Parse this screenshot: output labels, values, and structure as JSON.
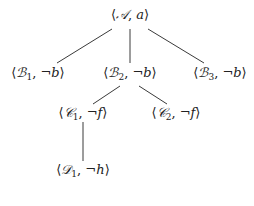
{
  "diagram": {
    "type": "tree",
    "edge_color": "#3a3a3a",
    "text_color": "#222222",
    "nodes": [
      {
        "id": "A",
        "open": "⟨",
        "set": "𝒜",
        "sub": "",
        "sep": ", ",
        "literal": "a",
        "close": "⟩",
        "x": 130,
        "y": 15
      },
      {
        "id": "B1",
        "open": "⟨",
        "set": "ℬ",
        "sub": "1",
        "sep": ", ",
        "literal": "¬b",
        "close": "⟩",
        "x": 38,
        "y": 72
      },
      {
        "id": "B2",
        "open": "⟨",
        "set": "ℬ",
        "sub": "2",
        "sep": ", ",
        "literal": "¬b",
        "close": "⟩",
        "x": 130,
        "y": 72
      },
      {
        "id": "B3",
        "open": "⟨",
        "set": "ℬ",
        "sub": "3",
        "sep": ", ",
        "literal": "¬b",
        "close": "⟩",
        "x": 220,
        "y": 72
      },
      {
        "id": "C1",
        "open": "⟨",
        "set": "𝒞",
        "sub": "1",
        "sep": ", ",
        "literal": "¬f",
        "close": "⟩",
        "x": 83,
        "y": 113
      },
      {
        "id": "C2",
        "open": "⟨",
        "set": "𝒞",
        "sub": "2",
        "sep": ", ",
        "literal": "¬f",
        "close": "⟩",
        "x": 176,
        "y": 113
      },
      {
        "id": "D1",
        "open": "⟨",
        "set": "𝒟",
        "sub": "1",
        "sep": ", ",
        "literal": "¬h",
        "close": "⟩",
        "x": 83,
        "y": 170
      }
    ],
    "edges": [
      {
        "from": "A",
        "to": "B1",
        "x1": 112,
        "y1": 29,
        "x2": 57,
        "y2": 63
      },
      {
        "from": "A",
        "to": "B2",
        "x1": 130,
        "y1": 29,
        "x2": 130,
        "y2": 63
      },
      {
        "from": "A",
        "to": "B3",
        "x1": 148,
        "y1": 29,
        "x2": 204,
        "y2": 63
      },
      {
        "from": "B2",
        "to": "C1",
        "x1": 120,
        "y1": 86,
        "x2": 93,
        "y2": 104
      },
      {
        "from": "B2",
        "to": "C2",
        "x1": 139,
        "y1": 86,
        "x2": 167,
        "y2": 104
      },
      {
        "from": "C1",
        "to": "D1",
        "x1": 83,
        "y1": 122,
        "x2": 83,
        "y2": 161
      }
    ]
  }
}
